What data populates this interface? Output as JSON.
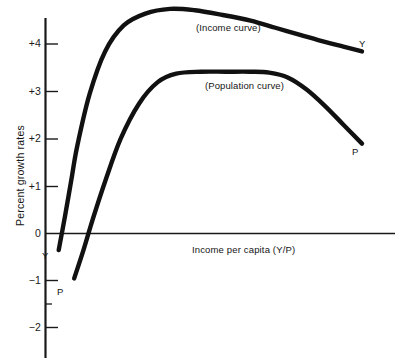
{
  "chart_data": {
    "type": "line",
    "title": "",
    "xlabel": "Income per capita (Y/P)",
    "ylabel": "Percent growth rates",
    "grid": false,
    "legend_position": "inline-annotation",
    "ylim": [
      -2.5,
      5.0
    ],
    "xlim": [
      0,
      100
    ],
    "y_ticks": [
      {
        "label": "+4",
        "value": 4
      },
      {
        "label": "+3",
        "value": 3
      },
      {
        "label": "+2",
        "value": 2
      },
      {
        "label": "+1",
        "value": 1
      },
      {
        "label": "0",
        "value": 0
      },
      {
        "label": "−1",
        "value": -1
      },
      {
        "label": "−2",
        "value": -2
      }
    ],
    "y_minor_ticks": [
      -1.5
    ],
    "x_ticks": [],
    "x_tick_labels": [],
    "series": [
      {
        "name": "Income curve",
        "annotation": "(Income curve)",
        "endpoint_label": "Y",
        "start_label": "Y",
        "x": [
          2,
          4,
          6,
          8,
          12,
          17,
          23,
          30,
          38,
          46,
          55,
          64,
          72,
          80,
          88,
          94,
          100
        ],
        "values": [
          -0.35,
          0.35,
          1.1,
          1.85,
          2.95,
          3.85,
          4.4,
          4.65,
          4.75,
          4.72,
          4.62,
          4.5,
          4.35,
          4.2,
          4.05,
          3.95,
          3.85
        ]
      },
      {
        "name": "Population curve",
        "annotation": "(Population curve)",
        "endpoint_label": "P",
        "start_label": "P",
        "x": [
          7,
          10,
          13,
          17,
          22,
          28,
          34,
          40,
          48,
          56,
          64,
          70,
          76,
          82,
          88,
          94,
          100
        ],
        "values": [
          -0.95,
          -0.35,
          0.3,
          1.1,
          2.0,
          2.75,
          3.2,
          3.38,
          3.42,
          3.42,
          3.42,
          3.4,
          3.3,
          3.05,
          2.7,
          2.3,
          1.9
        ]
      }
    ]
  },
  "annotations": {
    "income_curve_label": "(Income curve)",
    "population_curve_label": "(Population curve)",
    "income_endpoint": "Y",
    "population_endpoint": "P",
    "income_origin": "Y",
    "population_origin": "P"
  },
  "axes": {
    "y_title": "Percent growth rates",
    "x_title": "Income per capita (Y/P)",
    "tick_plus_4": "+4",
    "tick_plus_3": "+3",
    "tick_plus_2": "+2",
    "tick_plus_1": "+1",
    "tick_zero": "0",
    "tick_minus_1": "−1",
    "tick_minus_2": "−2"
  },
  "colors": {
    "curve": "#111111",
    "axis": "#1a1a1a",
    "background": "#ffffff",
    "text": "#151515"
  }
}
